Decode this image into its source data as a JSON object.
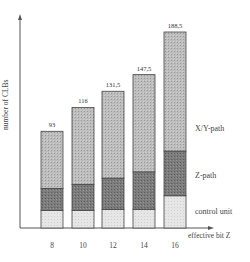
{
  "chart_data": {
    "type": "bar",
    "stacked": true,
    "title": "",
    "xlabel": "effective bit Z",
    "ylabel": "number of CLBs",
    "categories": [
      "8",
      "10",
      "12",
      "14",
      "16"
    ],
    "series": [
      {
        "name": "control unit",
        "values": [
          17,
          17,
          18,
          18,
          31
        ],
        "color": "#e2e2e2"
      },
      {
        "name": "Z-path",
        "values": [
          21,
          25,
          30,
          36,
          43
        ],
        "color": "#7a7a7a"
      },
      {
        "name": "X/Y-path",
        "values": [
          55,
          74,
          83.5,
          93.5,
          114.5
        ],
        "color": "#b4b4b4"
      }
    ],
    "totals": [
      "93",
      "116",
      "131,5",
      "147,5",
      "188,5"
    ],
    "total_values": [
      93,
      116,
      131.5,
      147.5,
      188.5
    ],
    "ylim": [
      0,
      200
    ],
    "grid": false,
    "legend_position": "right (inline labels)"
  },
  "labels": {
    "ylabel": "number of CLBs",
    "xlabel": "effective bit Z",
    "legend_xy": "X/Y-path",
    "legend_z": "Z-path",
    "legend_control": "control unit"
  }
}
